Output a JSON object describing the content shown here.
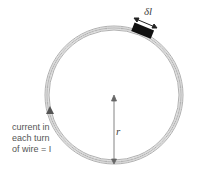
{
  "labels": {
    "element_length": "δl",
    "radius": "r",
    "current_line1": "current in",
    "current_line2": "each turn",
    "current_line3": "of wire = I"
  },
  "colors": {
    "coil": "#9a9a9a",
    "block": "#111111",
    "arrow": "#555555"
  }
}
